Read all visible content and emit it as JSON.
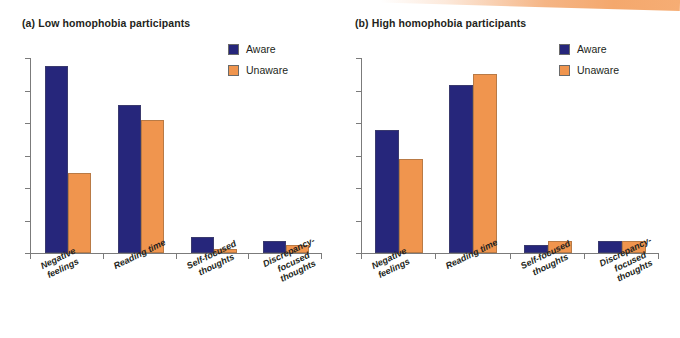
{
  "figure": {
    "decoration": "peach-diagonal-band",
    "colors": {
      "aware": "#26267B",
      "unaware": "#F0954E",
      "axis": "#7B7B7B",
      "text": "#231F20",
      "band": "#F4A86D"
    }
  },
  "legend": {
    "entries": [
      {
        "label": "Aware",
        "color": "#26267B"
      },
      {
        "label": "Unaware",
        "color": "#F0954E"
      }
    ]
  },
  "panels": [
    {
      "id": "a",
      "title": "(a) Low homophobia participants"
    },
    {
      "id": "b",
      "title": "(b) High homophobia participants"
    }
  ],
  "chart_data": [
    {
      "type": "bar",
      "title": "(a) Low homophobia participants",
      "xlabel": "",
      "ylabel": "",
      "ylim": [
        0,
        100
      ],
      "grid": false,
      "legend_position": "top-right",
      "axis_tick_labels": {
        "y": [],
        "x": []
      },
      "y_tick_count": 7,
      "categories": [
        "Negative\nfeelings",
        "Reading time",
        "Self-focused\nthoughts",
        "Discrepancy-focused\nthoughts"
      ],
      "series": [
        {
          "name": "Aware",
          "color": "#26267B",
          "values": [
            96,
            76,
            8,
            6
          ]
        },
        {
          "name": "Unaware",
          "color": "#F0954E",
          "values": [
            41,
            68,
            2,
            4
          ]
        }
      ]
    },
    {
      "type": "bar",
      "title": "(b) High homophobia participants",
      "xlabel": "",
      "ylabel": "",
      "ylim": [
        0,
        100
      ],
      "grid": false,
      "legend_position": "top-right",
      "axis_tick_labels": {
        "y": [],
        "x": []
      },
      "y_tick_count": 7,
      "categories": [
        "Negative\nfeelings",
        "Reading time",
        "Self-focused\nthoughts",
        "Discrepancy-focused\nthoughts"
      ],
      "series": [
        {
          "name": "Aware",
          "color": "#26267B",
          "values": [
            63,
            86,
            4,
            6
          ]
        },
        {
          "name": "Unaware",
          "color": "#F0954E",
          "values": [
            48,
            92,
            6,
            6
          ]
        }
      ]
    }
  ]
}
